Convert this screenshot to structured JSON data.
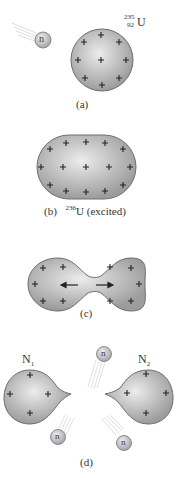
{
  "panels": {
    "a": {
      "label": "(a)",
      "isotope": {
        "mass": "235",
        "atomic": "92",
        "symbol": "U"
      },
      "neutron_label": "n"
    },
    "b": {
      "label": "(b)",
      "isotope_mass": "236",
      "isotope_symbol": "U",
      "state": "(excited)"
    },
    "c": {
      "label": "(c)"
    },
    "d": {
      "label": "(d)",
      "fragment1": {
        "symbol": "N",
        "subscript": "1"
      },
      "fragment2": {
        "symbol": "N",
        "subscript": "2"
      },
      "neutron_label": "n"
    }
  },
  "colors": {
    "nucleus_fill_light": "#e6e6e6",
    "nucleus_fill_dark": "#9a9a9a",
    "nucleus_stroke": "#6e6e6e",
    "plus": "#222222",
    "trail": "#c8c8c8"
  }
}
